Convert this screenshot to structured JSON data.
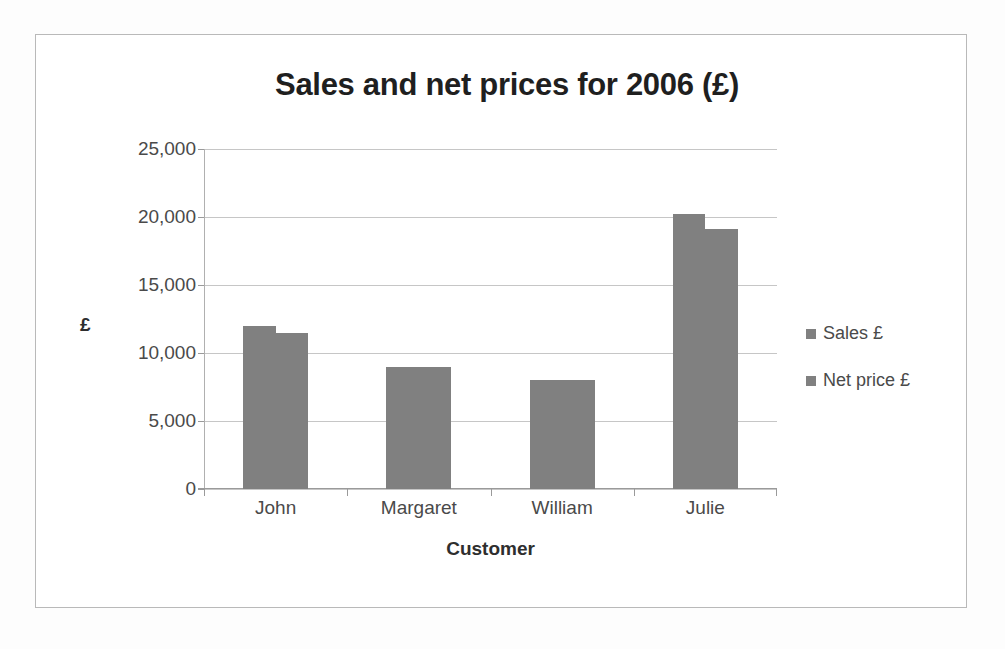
{
  "chart_data": {
    "type": "bar",
    "title": "Sales and net prices for 2006 (£)",
    "xlabel": "Customer",
    "ylabel": "£",
    "categories": [
      "John",
      "Margaret",
      "William",
      "Julie"
    ],
    "series": [
      {
        "name": "Sales £",
        "values": [
          12000,
          9000,
          8000,
          20200
        ],
        "color": "#808080"
      },
      {
        "name": "Net price £",
        "values": [
          11500,
          9000,
          8000,
          19100
        ],
        "color": "#808080"
      }
    ],
    "ylim": [
      0,
      25000
    ],
    "ytick_values": [
      0,
      5000,
      10000,
      15000,
      20000,
      25000
    ],
    "ytick_labels": [
      "0",
      "5,000",
      "10,000",
      "15,000",
      "20,000",
      "25,000"
    ],
    "grid": true,
    "legend_position": "right",
    "bar_gap_within_group": 0
  },
  "frame": {
    "border_color": "#b9b9b9",
    "background": "#ffffff"
  }
}
